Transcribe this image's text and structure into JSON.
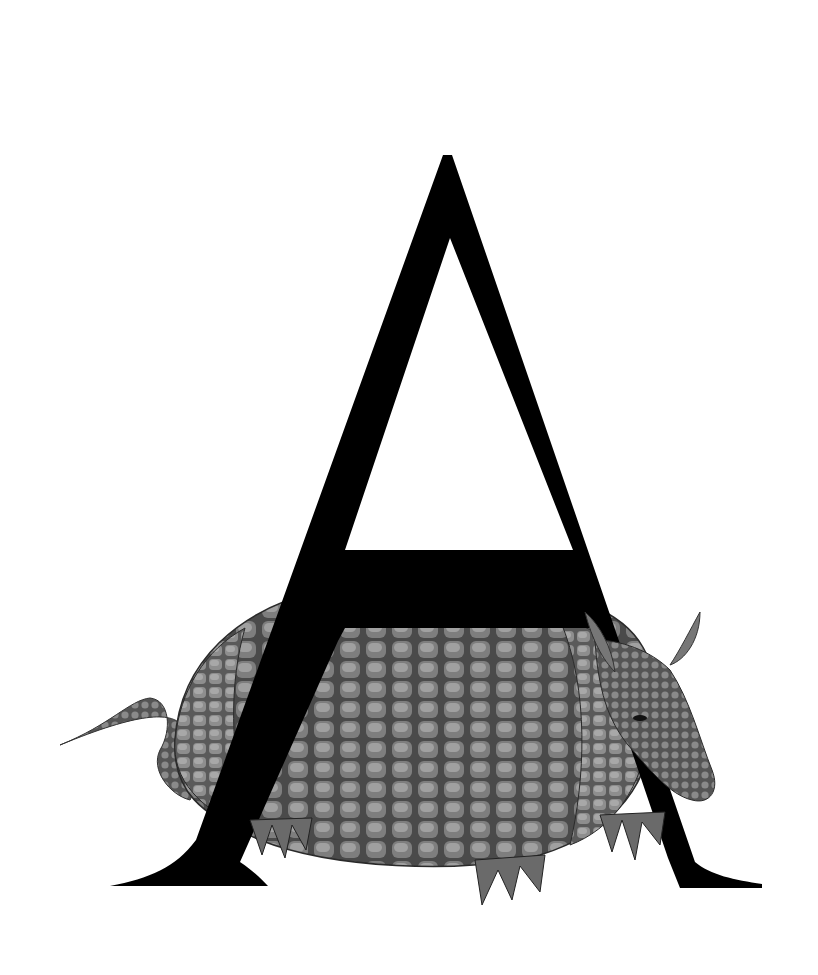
{
  "illustration": {
    "subject": "Letter A with armadillo",
    "letter": "A",
    "animal": "armadillo",
    "style": "grayscale engraving illustration",
    "colors": {
      "background": "#ffffff",
      "letter": "#000000",
      "shell_light": "#8a8a8a",
      "shell_dark": "#3a3a3a"
    }
  }
}
